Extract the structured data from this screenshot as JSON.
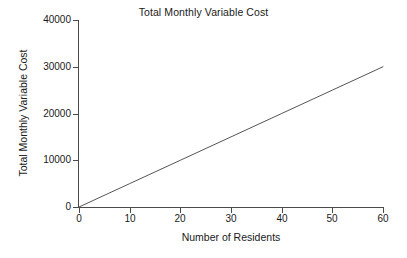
{
  "chart_data": {
    "type": "line",
    "title": "Total Monthly Variable Cost",
    "xlabel": "Number of Residents",
    "ylabel": "Total Monthly Variable Cost",
    "xlim": [
      0,
      60
    ],
    "ylim": [
      0,
      40000
    ],
    "xticks": [
      0,
      10,
      20,
      30,
      40,
      50,
      60
    ],
    "yticks": [
      0,
      10000,
      20000,
      30000,
      40000
    ],
    "xtick_labels": [
      "0",
      "10",
      "20",
      "30",
      "40",
      "50",
      "60"
    ],
    "ytick_labels": [
      "0",
      "10000",
      "20000",
      "30000",
      "40000"
    ],
    "grid": false,
    "legend": null,
    "legend_position": "none",
    "series": [
      {
        "name": "Total Monthly Variable Cost",
        "color": "#555555",
        "slope_per_resident": 500,
        "x": [
          0,
          10,
          20,
          30,
          40,
          50,
          60
        ],
        "values": [
          0,
          5000,
          10000,
          15000,
          20000,
          25000,
          30000
        ]
      }
    ]
  },
  "style": {
    "background": "#ffffff",
    "axis_color": "#4a4a4a",
    "text_color": "#1a1a1a",
    "line_color": "#555555"
  }
}
